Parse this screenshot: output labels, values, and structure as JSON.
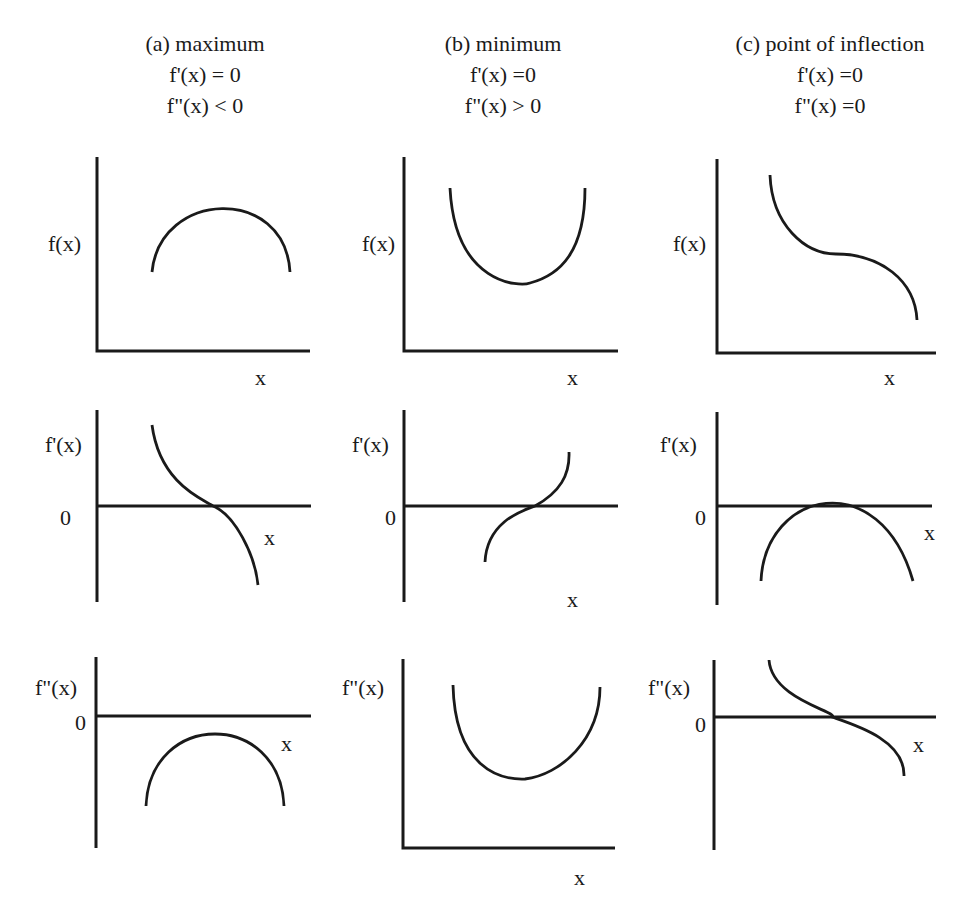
{
  "figure": {
    "columns": [
      {
        "id": "a",
        "title": "(a) maximum",
        "cond1": "f'(x) = 0",
        "cond2": "f\"(x) < 0",
        "title_pos": [
          205,
          51
        ],
        "cond1_pos": [
          205,
          82
        ],
        "cond2_pos": [
          205,
          113
        ]
      },
      {
        "id": "b",
        "title": "(b) minimum",
        "cond1": "f'(x) =0",
        "cond2": "f\"(x) > 0",
        "title_pos": [
          503,
          51
        ],
        "cond1_pos": [
          503,
          82
        ],
        "cond2_pos": [
          503,
          113
        ]
      },
      {
        "id": "c",
        "title": "(c) point of inflection",
        "cond1": "f'(x) =0",
        "cond2": "f\"(x) =0",
        "title_pos": [
          830,
          51
        ],
        "cond1_pos": [
          830,
          82
        ],
        "cond2_pos": [
          830,
          113
        ]
      }
    ],
    "panels": [
      {
        "name": "panel-a-f",
        "ylabel": "f(x)",
        "ylabel_pos": [
          48,
          251
        ],
        "xlabel": "x",
        "xlabel_pos": [
          255,
          385
        ],
        "zero_label": null,
        "axes": "M97,157 L97,351 L310,351",
        "curve": "M152,272 C160,190 285,185 290,272"
      },
      {
        "name": "panel-b-f",
        "ylabel": "f(x)",
        "ylabel_pos": [
          362,
          251
        ],
        "xlabel": "x",
        "xlabel_pos": [
          567,
          385
        ],
        "zero_label": null,
        "axes": "M404,157 L404,351 L618,351",
        "curve": "M450,188 C455,285 520,287 530,283 C560,275 585,252 585,188"
      },
      {
        "name": "panel-c-f",
        "ylabel": "f(x)",
        "ylabel_pos": [
          673,
          251
        ],
        "xlabel": "x",
        "xlabel_pos": [
          884,
          385
        ],
        "zero_label": null,
        "axes": "M717,159 L717,353 L936,353",
        "curve": "M770,175 C772,225 805,254 836,254 C880,254 915,280 917,320"
      },
      {
        "name": "panel-a-fprime",
        "ylabel": "f'(x)",
        "ylabel_pos": [
          45,
          452
        ],
        "xlabel": "x",
        "xlabel_pos": [
          264,
          545
        ],
        "zero_label": "0",
        "zero_label_pos": [
          60,
          525
        ],
        "axes": "M97,410 L97,602 M97,506 L311,506",
        "curve": "M152,425 C160,485 205,500 213,506 C235,515 255,555 258,585"
      },
      {
        "name": "panel-b-fprime",
        "ylabel": "f'(x)",
        "ylabel_pos": [
          352,
          452
        ],
        "xlabel": "x",
        "xlabel_pos": [
          567,
          607
        ],
        "zero_label": "0",
        "zero_label_pos": [
          385,
          525
        ],
        "axes": "M404,410 L404,602 M404,506 L618,506",
        "curve": "M485,562 C487,520 525,510 535,506 C560,492 570,475 569,452"
      },
      {
        "name": "panel-c-fprime",
        "ylabel": "f'(x)",
        "ylabel_pos": [
          660,
          452
        ],
        "xlabel": "x",
        "xlabel_pos": [
          924,
          540
        ],
        "zero_label": "0",
        "zero_label_pos": [
          695,
          525
        ],
        "axes": "M717,412 L717,605 M717,506 L932,506",
        "curve": "M761,581 C765,490 880,465 913,581"
      },
      {
        "name": "panel-a-fdoubleprime",
        "ylabel": "f\"(x)",
        "ylabel_pos": [
          35,
          695
        ],
        "xlabel": "x",
        "xlabel_pos": [
          281,
          751
        ],
        "zero_label": "0",
        "zero_label_pos": [
          75,
          730
        ],
        "axes": "M96,657 L96,848 M96,716 L311,716",
        "curve": "M146,806 C150,710 280,710 284,806"
      },
      {
        "name": "panel-b-fdoubleprime",
        "ylabel": "f\"(x)",
        "ylabel_pos": [
          342,
          695
        ],
        "xlabel": "x",
        "xlabel_pos": [
          574,
          885
        ],
        "zero_label": null,
        "axes": "M403,659 L403,848 L615,848",
        "curve": "M453,685 C455,768 500,780 525,779 C560,775 600,740 600,687"
      },
      {
        "name": "panel-c-fdoubleprime",
        "ylabel": "f\"(x)",
        "ylabel_pos": [
          648,
          695
        ],
        "xlabel": "x",
        "xlabel_pos": [
          913,
          752
        ],
        "zero_label": "0",
        "zero_label_pos": [
          695,
          732
        ],
        "axes": "M714,660 L714,850 M714,717 L936,717",
        "curve": "M769,660 C772,700 840,712 832,717 C855,725 905,740 904,776"
      }
    ]
  }
}
